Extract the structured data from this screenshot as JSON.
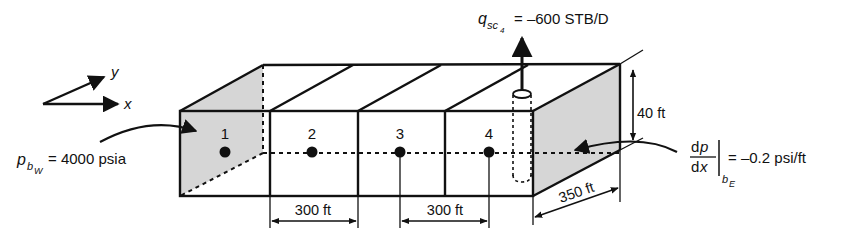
{
  "diagram": {
    "axes": {
      "x_label": "x",
      "y_label": "y"
    },
    "blocks": [
      {
        "id": 1,
        "label": "1"
      },
      {
        "id": 2,
        "label": "2"
      },
      {
        "id": 3,
        "label": "3"
      },
      {
        "id": 4,
        "label": "4"
      }
    ],
    "west_boundary": {
      "symbol": "p",
      "subscript": "b",
      "sub_subscript": "W",
      "equals_text": "= 4000 psia"
    },
    "east_boundary": {
      "numerator": "dp",
      "numerator_plain": "d",
      "numerator_var": "p",
      "denominator_plain": "d",
      "denominator_var": "x",
      "subscript": "b",
      "sub_subscript": "E",
      "equals_text": "= –0.2 psi/ft"
    },
    "well": {
      "symbol": "q",
      "subscript": "sc",
      "sub_subscript": "4",
      "equals_text": "= –600 STB/D"
    },
    "dimensions": {
      "block_length_1": "300 ft",
      "block_length_2": "300 ft",
      "width": "350 ft",
      "thickness": "40 ft"
    },
    "colors": {
      "line": "#111111",
      "shade": "#d6d6d6"
    }
  }
}
